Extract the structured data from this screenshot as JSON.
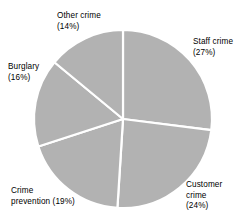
{
  "chart_data": {
    "type": "pie",
    "title": "",
    "subtitle": "",
    "xlabel": "",
    "ylabel": "",
    "legend_position": "none",
    "grid": false,
    "value_unit": "percent",
    "start_angle_deg": 0,
    "direction": "clockwise",
    "slice_color": "#b2b2b2",
    "slice_separator_color": "#ffffff",
    "categories": [
      "Staff crime",
      "Customer crime",
      "Crime prevention",
      "Burglary",
      "Other crime"
    ],
    "values": [
      27,
      24,
      19,
      16,
      14
    ],
    "slices": [
      {
        "label": "Staff crime",
        "value": 27,
        "value_text": "(27%)",
        "label_lines": "Staff crime\n(27%)",
        "start_deg": 0,
        "end_deg": 97.2,
        "color": "#b2b2b2"
      },
      {
        "label": "Customer crime",
        "value": 24,
        "value_text": "(24%)",
        "label_lines": "Customer\ncrime\n(24%)",
        "start_deg": 97.2,
        "end_deg": 183.6,
        "color": "#b2b2b2"
      },
      {
        "label": "Crime prevention",
        "value": 19,
        "value_text": "(19%)",
        "label_lines": "Crime\nprevention (19%)",
        "start_deg": 183.6,
        "end_deg": 252.0,
        "color": "#b2b2b2"
      },
      {
        "label": "Burglary",
        "value": 16,
        "value_text": "(16%)",
        "label_lines": "Burglary\n(16%)",
        "start_deg": 252.0,
        "end_deg": 309.6,
        "color": "#b2b2b2"
      },
      {
        "label": "Other crime",
        "value": 14,
        "value_text": "(14%)",
        "label_lines": "Other crime\n(14%)",
        "start_deg": 309.6,
        "end_deg": 360.0,
        "color": "#b2b2b2"
      }
    ]
  },
  "labels": {
    "other_crime": "Other crime\n(14%)",
    "staff_crime": "Staff crime\n(27%)",
    "burglary": "Burglary\n(16%)",
    "crime_prevention": "Crime\nprevention (19%)",
    "customer_crime": "Customer\ncrime\n(24%)"
  },
  "geometry": {
    "center_x": 123,
    "center_y": 119,
    "radius": 89
  },
  "colors": {
    "background": "#ffffff",
    "slice_fill": "#b2b2b2",
    "separator": "#ffffff",
    "text": "#000000"
  }
}
